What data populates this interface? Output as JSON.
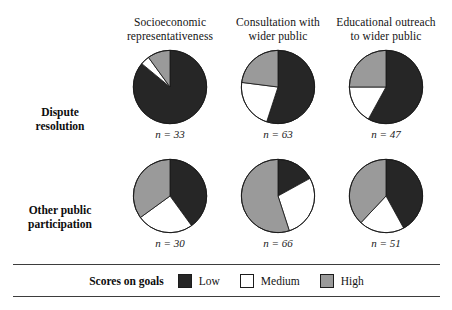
{
  "chart_data": {
    "type": "pie",
    "title": "",
    "legend": {
      "title": "Scores on goals",
      "position": "bottom",
      "entries": [
        {
          "label": "Low",
          "color": "#262626"
        },
        {
          "label": "Medium",
          "color": "#ffffff"
        },
        {
          "label": "High",
          "color": "#9a9a9a"
        }
      ]
    },
    "columns": [
      {
        "line1": "Socioeconomic",
        "line2": "representativeness"
      },
      {
        "line1": "Consultation with",
        "line2": "wider public"
      },
      {
        "line1": "Educational outreach",
        "line2": "to wider public"
      }
    ],
    "rows": [
      {
        "line1": "Dispute",
        "line2": "resolution"
      },
      {
        "line1": "Other public",
        "line2": "participation"
      }
    ],
    "series": [
      {
        "name": "Low",
        "color": "#262626"
      },
      {
        "name": "Medium",
        "color": "#ffffff"
      },
      {
        "name": "High",
        "color": "#9a9a9a"
      }
    ],
    "pies": [
      {
        "row": "Dispute resolution",
        "column": "Socioeconomic representativeness",
        "n_label": "n = 33",
        "n": 33,
        "values": [
          86,
          4,
          10
        ]
      },
      {
        "row": "Dispute resolution",
        "column": "Consultation with wider public",
        "n_label": "n = 63",
        "n": 63,
        "values": [
          55,
          22,
          23
        ]
      },
      {
        "row": "Dispute resolution",
        "column": "Educational outreach to wider public",
        "n_label": "n = 47",
        "n": 47,
        "values": [
          58,
          17,
          25
        ]
      },
      {
        "row": "Other public participation",
        "column": "Socioeconomic representativeness",
        "n_label": "n = 30",
        "n": 30,
        "values": [
          40,
          25,
          35
        ]
      },
      {
        "row": "Other public participation",
        "column": "Consultation with wider public",
        "n_label": "n = 66",
        "n": 66,
        "values": [
          17,
          28,
          55
        ]
      },
      {
        "row": "Other public participation",
        "column": "Educational outreach to wider public",
        "n_label": "n = 51",
        "n": 51,
        "values": [
          42,
          20,
          38
        ]
      }
    ]
  },
  "headers": {
    "col0_l1": "Socioeconomic",
    "col0_l2": "representativeness",
    "col1_l1": "Consultation with",
    "col1_l2": "wider public",
    "col2_l1": "Educational outreach",
    "col2_l2": "to wider public"
  },
  "rows": {
    "row0_l1": "Dispute",
    "row0_l2": "resolution",
    "row1_l1": "Other public",
    "row1_l2": "participation"
  },
  "pie_labels": {
    "p0": "n = 33",
    "p1": "n = 63",
    "p2": "n = 47",
    "p3": "n = 30",
    "p4": "n = 66",
    "p5": "n = 51"
  },
  "legend": {
    "title": "Scores on goals",
    "low": "Low",
    "medium": "Medium",
    "high": "High"
  }
}
